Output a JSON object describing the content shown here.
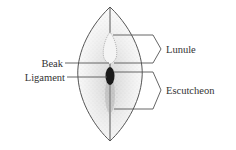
{
  "diagram": {
    "labels": {
      "beak": "Beak",
      "ligament": "Ligament",
      "lunule": "Lunule",
      "escutcheon": "Escutcheon"
    },
    "colors": {
      "line": "#555555",
      "text": "#333333",
      "stipple": "#777777",
      "ligament_fill": "#1a1a1a",
      "background": "#ffffff"
    }
  }
}
